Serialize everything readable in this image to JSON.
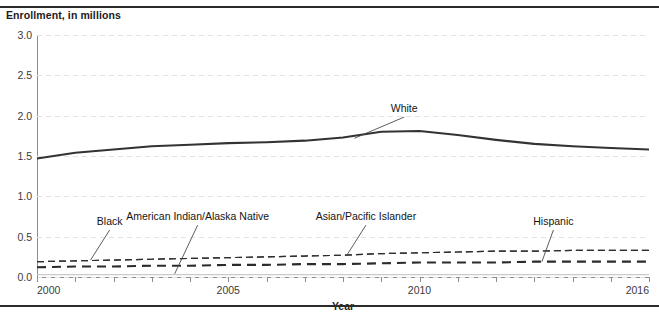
{
  "figure": {
    "axis_title": "Enrollment, in millions",
    "xaxis_label": "Year"
  },
  "chart_data": {
    "type": "line",
    "title": "Enrollment, in millions",
    "xlabel": "Year",
    "ylabel": "Enrollment, in millions",
    "xlim": [
      2000,
      2016
    ],
    "ylim": [
      0.0,
      3.0
    ],
    "grid": true,
    "legend_position": "inline-annotations",
    "xticks": [
      2000,
      2005,
      2010,
      2016
    ],
    "xtick_labels": [
      "2000",
      "2005",
      "2010",
      "2016"
    ],
    "yticks": [
      0.0,
      0.5,
      1.0,
      1.5,
      2.0,
      2.5,
      3.0
    ],
    "ytick_labels": [
      "0.0",
      "0.5",
      "1.0",
      "1.5",
      "2.0",
      "2.5",
      "3.0"
    ],
    "x": [
      2000,
      2001,
      2002,
      2003,
      2004,
      2005,
      2006,
      2007,
      2008,
      2009,
      2010,
      2011,
      2012,
      2013,
      2014,
      2015,
      2016
    ],
    "series": [
      {
        "name": "White",
        "style": "solid",
        "width": "bold",
        "color": "#333333",
        "values": [
          1.47,
          1.54,
          1.58,
          1.62,
          1.64,
          1.66,
          1.67,
          1.69,
          1.73,
          1.8,
          1.81,
          1.76,
          1.7,
          1.65,
          1.62,
          1.6,
          1.58
        ]
      },
      {
        "name": "Asian/Pacific Islander",
        "style": "dashed",
        "width": "thin",
        "color": "#2f2f2f",
        "values": [
          0.19,
          0.2,
          0.21,
          0.22,
          0.23,
          0.24,
          0.25,
          0.26,
          0.27,
          0.29,
          0.3,
          0.31,
          0.32,
          0.32,
          0.33,
          0.33,
          0.33
        ]
      },
      {
        "name": "Black",
        "style": "dashed",
        "width": "thin",
        "color": "#2f2f2f",
        "values": [
          0.19,
          0.2,
          0.21,
          0.22,
          0.23,
          0.24,
          0.25,
          0.26,
          0.27,
          0.29,
          0.3,
          0.31,
          0.32,
          0.32,
          0.33,
          0.33,
          0.33
        ]
      },
      {
        "name": "Hispanic",
        "style": "dashed",
        "width": "bold",
        "color": "#2b2b2b",
        "values": [
          0.12,
          0.13,
          0.13,
          0.14,
          0.14,
          0.15,
          0.15,
          0.16,
          0.16,
          0.17,
          0.18,
          0.18,
          0.18,
          0.19,
          0.19,
          0.19,
          0.19
        ]
      },
      {
        "name": "American Indian/Alaska Native",
        "style": "solid",
        "width": "faint",
        "color": "#c9c9c9",
        "values": [
          0.03,
          0.03,
          0.03,
          0.03,
          0.03,
          0.03,
          0.03,
          0.03,
          0.03,
          0.03,
          0.03,
          0.03,
          0.03,
          0.03,
          0.03,
          0.03,
          0.03
        ]
      }
    ],
    "annotations": [
      {
        "text": "White",
        "label_x": 2009.6,
        "label_y": 2.02,
        "point_x": 2008.3,
        "point_y": 1.72
      },
      {
        "text": "Black",
        "label_x": 2001.9,
        "label_y": 0.62,
        "point_x": 2001.4,
        "point_y": 0.21
      },
      {
        "text": "American Indian/Alaska Native",
        "label_x": 2004.2,
        "label_y": 0.68,
        "point_x": 2003.6,
        "point_y": 0.04
      },
      {
        "text": "Asian/Pacific Islander",
        "label_x": 2008.6,
        "label_y": 0.68,
        "point_x": 2008.1,
        "point_y": 0.27
      },
      {
        "text": "Hispanic",
        "label_x": 2013.5,
        "label_y": 0.62,
        "point_x": 2013.2,
        "point_y": 0.19
      }
    ]
  }
}
